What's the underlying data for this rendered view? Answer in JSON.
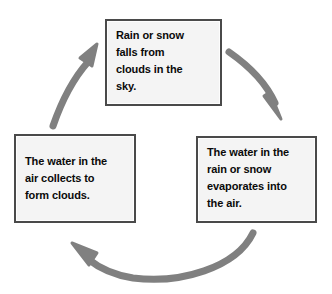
{
  "diagram": {
    "type": "cycle",
    "direction": "clockwise",
    "background_color": "#ffffff",
    "box_fill_color": "#f4f4f4",
    "box_border_color": "#4a4a4a",
    "arrow_color": "#808080",
    "text_color": "#0a0a0a"
  },
  "nodes": [
    {
      "id": "precipitation",
      "position": "top",
      "text": "Rain or snow falls from clouds in the sky.",
      "lines": "Rain or snow\nfalls from\nclouds in the\nsky."
    },
    {
      "id": "evaporation",
      "position": "right",
      "text": "The water in the rain or snow evaporates into the air.",
      "lines": "The water in the\nrain or snow\nevaporates into\nthe air."
    },
    {
      "id": "condensation",
      "position": "left",
      "text": "The water in the air collects to form clouds.",
      "lines": "The water in the\nair collects to\nform clouds."
    }
  ],
  "arrows": [
    {
      "id": "precipitation-to-evaporation",
      "from": "precipitation",
      "to": "evaporation",
      "label": "",
      "shape": "curve-down-right"
    },
    {
      "id": "evaporation-to-condensation",
      "from": "evaporation",
      "to": "condensation",
      "label": "",
      "shape": "curve-bottom-left"
    },
    {
      "id": "condensation-to-precipitation",
      "from": "condensation",
      "to": "precipitation",
      "label": "",
      "shape": "curve-up-right"
    }
  ]
}
